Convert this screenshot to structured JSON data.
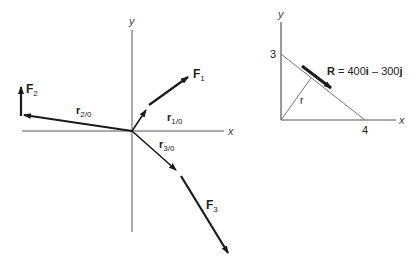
{
  "left_diagram": {
    "axes": {
      "x_label": "x",
      "y_label": "y"
    },
    "vectors": [
      {
        "id": "F1",
        "label": "F",
        "sub": "1",
        "bold": true
      },
      {
        "id": "F2",
        "label": "F",
        "sub": "2",
        "bold": true
      },
      {
        "id": "F3",
        "label": "F",
        "sub": "3",
        "bold": true
      },
      {
        "id": "r1",
        "label": "r",
        "sub": "1/0",
        "bold": true
      },
      {
        "id": "r2",
        "label": "r",
        "sub": "2/0",
        "bold": true
      },
      {
        "id": "r3",
        "label": "r",
        "sub": "3/0",
        "bold": true
      }
    ]
  },
  "right_diagram": {
    "axes": {
      "x_label": "x",
      "y_label": "y"
    },
    "y_intercept": "3",
    "x_intercept": "4",
    "r_label": "r",
    "resultant": {
      "bold_part": "R",
      "equation": " = 400",
      "i": "i",
      "minus": " – 300",
      "j": "j"
    }
  },
  "colors": {
    "ink": "#1a1a1a",
    "axis": "#555555",
    "thin": "#666666"
  }
}
